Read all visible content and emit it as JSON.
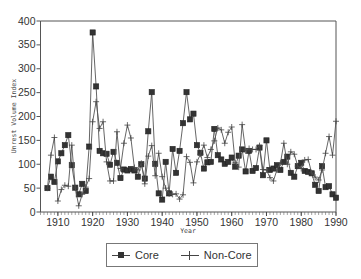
{
  "chart_data": {
    "type": "line",
    "title": "",
    "xlabel": "Year",
    "ylabel": "Unrest Volume Index",
    "xlim": [
      1905,
      1990
    ],
    "ylim": [
      0,
      400
    ],
    "x_ticks": [
      1910,
      1920,
      1930,
      1940,
      1950,
      1960,
      1970,
      1980,
      1990
    ],
    "y_ticks": [
      0,
      50,
      100,
      150,
      200,
      250,
      300,
      350,
      400
    ],
    "grid": false,
    "legend_position": "bottom",
    "x_start": 1907,
    "x_step": 1,
    "series": [
      {
        "name": "Core",
        "marker": "square",
        "values": [
          50,
          74,
          63,
          106,
          123,
          140,
          161,
          98,
          51,
          37,
          59,
          44,
          137,
          376,
          263,
          128,
          123,
          122,
          99,
          126,
          103,
          71,
          89,
          87,
          90,
          87,
          74,
          100,
          70,
          169,
          251,
          101,
          39,
          26,
          105,
          39,
          132,
          82,
          128,
          186,
          251,
          194,
          206,
          140,
          124,
          91,
          104,
          105,
          174,
          119,
          110,
          101,
          105,
          114,
          95,
          118,
          131,
          85,
          128,
          86,
          92,
          135,
          77,
          150,
          88,
          91,
          98,
          88,
          105,
          116,
          82,
          74,
          96,
          103,
          86,
          84,
          81,
          57,
          44,
          96,
          52,
          54,
          37,
          30
        ]
      },
      {
        "name": "Non-Core",
        "marker": "plus",
        "values": [
          50,
          119,
          156,
          23,
          47,
          56,
          54,
          140,
          50,
          13,
          37,
          52,
          70,
          189,
          231,
          175,
          189,
          105,
          65,
          65,
          168,
          91,
          144,
          182,
          155,
          93,
          88,
          102,
          59,
          117,
          139,
          76,
          123,
          74,
          50,
          38,
          37,
          38,
          27,
          36,
          116,
          104,
          61,
          105,
          121,
          140,
          114,
          131,
          149,
          176,
          172,
          144,
          167,
          178,
          103,
          94,
          183,
          128,
          133,
          131,
          131,
          139,
          89,
          88,
          72,
          65,
          88,
          102,
          144,
          100,
          126,
          121,
          96,
          91,
          109,
          110,
          82,
          73,
          67,
          88,
          123,
          158,
          119,
          190
        ]
      }
    ]
  },
  "axes": {
    "x_title": "Year",
    "y_title": "Unrest Volume Index"
  },
  "legend": {
    "core_label": "Core",
    "noncore_label": "Non-Core"
  }
}
